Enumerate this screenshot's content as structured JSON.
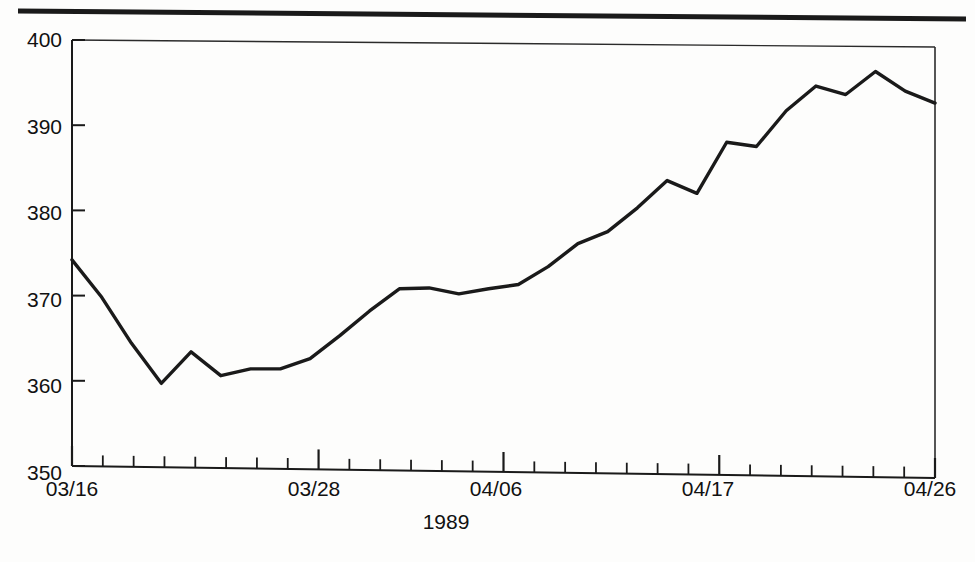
{
  "chart_data": {
    "type": "line",
    "title": "",
    "subtitle": "",
    "xlabel": "1989",
    "ylabel": "",
    "grid": false,
    "legend": false,
    "legend_position": "none",
    "line_color": "#1a1a1a",
    "axis_color": "#1a1a1a",
    "background_color": "#ffffff",
    "xlim_labels": [
      "03/16",
      "04/26"
    ],
    "ylim": [
      350,
      400
    ],
    "ytick_values": [
      350,
      360,
      370,
      380,
      390,
      400
    ],
    "ytick_labels": [
      "350",
      "360",
      "370",
      "380",
      "390",
      "400"
    ],
    "xtick_labels": [
      "03/16",
      "03/28",
      "04/06",
      "04/17",
      "04/26"
    ],
    "xtick_label_indices": [
      0,
      8,
      14,
      21,
      28
    ],
    "n_minor_ticks": 29,
    "x": [
      "03/16",
      "03/17",
      "03/20",
      "03/21",
      "03/22",
      "03/23",
      "03/24",
      "03/27",
      "03/28",
      "03/29",
      "03/30",
      "03/31",
      "04/03",
      "04/04",
      "04/05",
      "04/06",
      "04/07",
      "04/10",
      "04/11",
      "04/12",
      "04/13",
      "04/14",
      "04/17",
      "04/18",
      "04/19",
      "04/20",
      "04/21",
      "04/24",
      "04/25",
      "04/26"
    ],
    "values": [
      374.2,
      369.8,
      364.4,
      359.7,
      363.4,
      360.6,
      361.4,
      361.4,
      362.6,
      365.3,
      368.2,
      370.8,
      370.9,
      370.2,
      370.8,
      371.3,
      373.4,
      376.1,
      377.5,
      380.3,
      383.5,
      382.0,
      388.0,
      387.5,
      391.7,
      394.6,
      393.6,
      396.3,
      394.0,
      392.6
    ],
    "series_name": "index-level"
  },
  "figure": {
    "top_rule_name": "header-rule"
  }
}
